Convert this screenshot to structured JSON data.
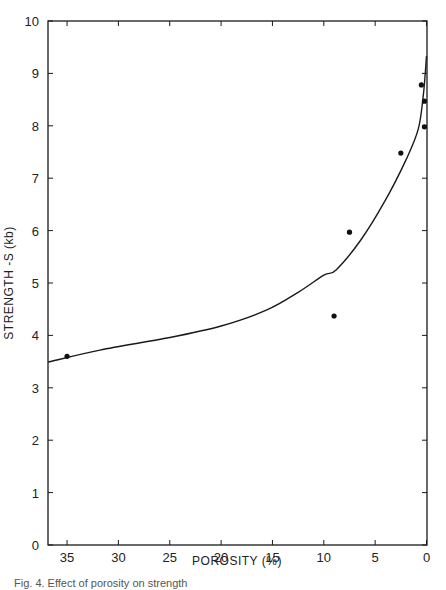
{
  "chart_data": {
    "type": "scatter",
    "title": "",
    "xlabel": "POROSITY (%)",
    "ylabel": "STRENGTH -S (kb)",
    "xlim": [
      37,
      0
    ],
    "ylim": [
      0,
      10
    ],
    "x_reversed": true,
    "grid": false,
    "x_ticks": [
      35,
      30,
      25,
      20,
      15,
      10,
      5,
      0
    ],
    "x_tick_labels": [
      "35",
      "30",
      "25",
      "20",
      "15",
      "10",
      "5",
      "0"
    ],
    "y_ticks": [
      0,
      1,
      2,
      3,
      4,
      5,
      6,
      7,
      8,
      9,
      10
    ],
    "y_tick_labels": [
      "0",
      "1",
      "2",
      "3",
      "4",
      "5",
      "6",
      "7",
      "8",
      "9",
      "10"
    ],
    "series": [
      {
        "name": "measured",
        "kind": "scatter",
        "points": [
          {
            "x": 35.0,
            "y": 3.6
          },
          {
            "x": 9.0,
            "y": 4.37
          },
          {
            "x": 7.5,
            "y": 5.97
          },
          {
            "x": 2.5,
            "y": 7.48
          },
          {
            "x": 0.5,
            "y": 8.78
          },
          {
            "x": 0.2,
            "y": 8.47
          },
          {
            "x": 0.2,
            "y": 7.98
          }
        ]
      },
      {
        "name": "fit curve",
        "kind": "line",
        "points": [
          {
            "x": 37.0,
            "y": 3.49
          },
          {
            "x": 31.8,
            "y": 3.72
          },
          {
            "x": 25.0,
            "y": 3.96
          },
          {
            "x": 20.0,
            "y": 4.18
          },
          {
            "x": 15.6,
            "y": 4.48
          },
          {
            "x": 12.5,
            "y": 4.82
          },
          {
            "x": 10.0,
            "y": 5.15
          },
          {
            "x": 8.8,
            "y": 5.25
          },
          {
            "x": 6.4,
            "y": 5.82
          },
          {
            "x": 4.0,
            "y": 6.58
          },
          {
            "x": 2.0,
            "y": 7.35
          },
          {
            "x": 0.8,
            "y": 7.94
          },
          {
            "x": 0.3,
            "y": 8.6
          },
          {
            "x": 0.0,
            "y": 9.33
          }
        ]
      }
    ]
  },
  "caption": "Fig. 4. Effect of porosity on strength"
}
